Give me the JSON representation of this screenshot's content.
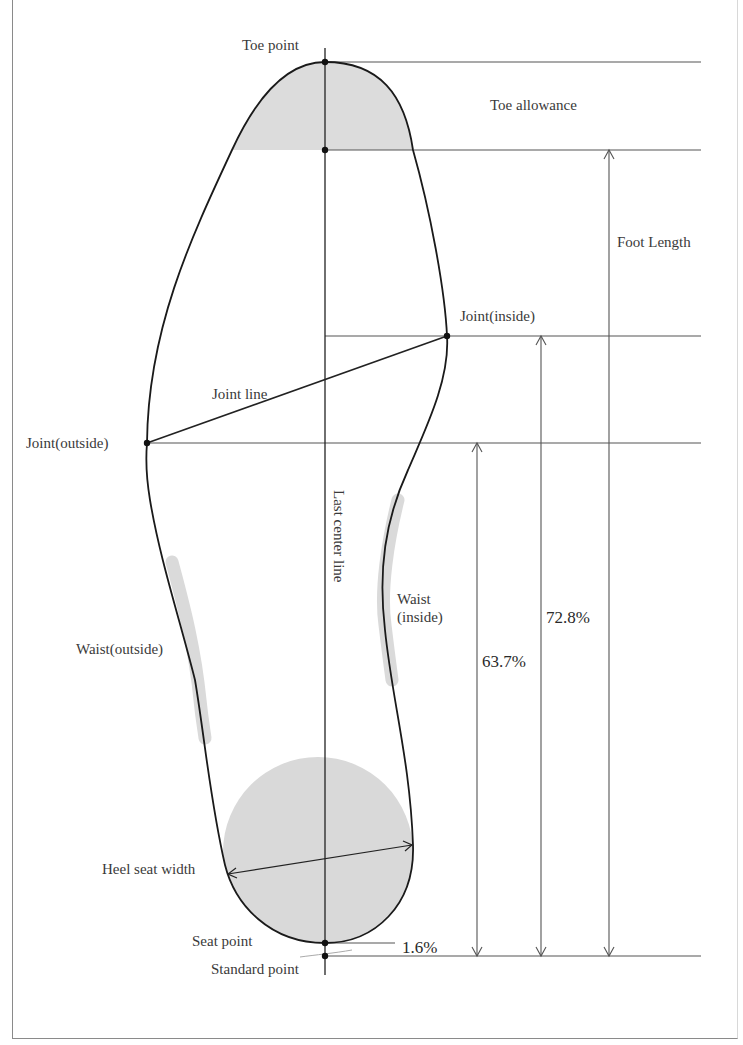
{
  "diagram": {
    "labels": {
      "toe_point": "Toe point",
      "toe_allowance": "Toe allowance",
      "foot_length": "Foot Length",
      "joint_inside": "Joint(inside)",
      "joint_line": "Joint line",
      "joint_outside": "Joint(outside)",
      "last_center_line": "Last center line",
      "waist_inside_1": "Waist",
      "waist_inside_2": "(inside)",
      "waist_outside": "Waist(outside)",
      "heel_seat_width": "Heel seat width",
      "seat_point": "Seat point",
      "standard_point": "Standard point"
    },
    "measurements": {
      "joint_outside_ratio": "63.7%",
      "joint_inside_ratio": "72.8%",
      "seat_offset_ratio": "1.6%"
    },
    "colors": {
      "outline": "#1a1a1a",
      "guide_lines": "#555555",
      "shading": "#d9d9d9",
      "text": "#3a3a3a",
      "background": "#ffffff"
    }
  }
}
